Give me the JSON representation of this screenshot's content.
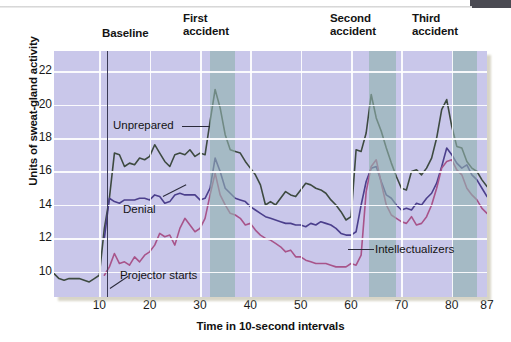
{
  "figure": {
    "corner_bar_color": "#4a4a52",
    "plot_bg_color": "#c9c7ea",
    "band_color": "#8fb2ae"
  },
  "headers": {
    "baseline": "Baseline",
    "first_accident": "First\naccident",
    "first_accident_l1": "First",
    "first_accident_l2": "accident",
    "second_accident_l1": "Second",
    "second_accident_l2": "accident",
    "third_accident_l1": "Third",
    "third_accident_l2": "accident"
  },
  "annotations": {
    "unprepared": "Unprepared",
    "denial": "Denial",
    "intellectualizers": "Intellectualizers",
    "projector_starts": "Projector starts"
  },
  "chart_data": {
    "type": "line",
    "title": "",
    "xlabel": "Time in 10-second intervals",
    "ylabel": "Units of sweat-gland activity",
    "xlim": [
      1,
      87
    ],
    "ylim": [
      8.5,
      23.2
    ],
    "xticks": [
      10,
      20,
      30,
      40,
      50,
      60,
      70,
      80,
      87
    ],
    "yticks": [
      10,
      12,
      14,
      16,
      18,
      20,
      22
    ],
    "grid": true,
    "legend": "inline-annotations",
    "event_markers": [
      {
        "name": "Projector starts",
        "x": 11.5,
        "type": "vline"
      },
      {
        "name": "First accident",
        "x_start": 32,
        "x_end": 37,
        "type": "band"
      },
      {
        "name": "Second accident",
        "x_start": 63.5,
        "x_end": 69,
        "type": "band"
      },
      {
        "name": "Third accident",
        "x_start": 80,
        "x_end": 85,
        "type": "band"
      }
    ],
    "x": [
      1,
      2,
      3,
      4,
      5,
      6,
      7,
      8,
      9,
      10,
      11,
      12,
      13,
      14,
      15,
      16,
      17,
      18,
      19,
      20,
      21,
      22,
      23,
      24,
      25,
      26,
      27,
      28,
      29,
      30,
      31,
      32,
      33,
      34,
      35,
      36,
      37,
      38,
      39,
      40,
      41,
      42,
      43,
      44,
      45,
      46,
      47,
      48,
      49,
      50,
      51,
      52,
      53,
      54,
      55,
      56,
      57,
      58,
      59,
      60,
      61,
      62,
      63,
      64,
      65,
      66,
      67,
      68,
      69,
      70,
      71,
      72,
      73,
      74,
      75,
      76,
      77,
      78,
      79,
      80,
      81,
      82,
      83,
      84,
      85,
      86,
      87
    ],
    "series": [
      {
        "name": "Unprepared",
        "color": "#3d4a40",
        "values": [
          9.9,
          9.6,
          9.5,
          9.6,
          9.6,
          9.6,
          9.5,
          9.4,
          9.6,
          9.8,
          12.6,
          14.4,
          17.1,
          17.0,
          16.3,
          16.5,
          16.4,
          16.8,
          16.7,
          16.9,
          17.6,
          17.1,
          16.6,
          16.3,
          17.0,
          17.1,
          17.0,
          17.3,
          16.9,
          17.1,
          17.0,
          19.0,
          20.9,
          19.8,
          18.2,
          17.3,
          17.2,
          17.1,
          16.6,
          16.2,
          15.8,
          15.2,
          14.0,
          14.2,
          14.0,
          14.4,
          14.8,
          14.6,
          14.5,
          14.9,
          15.3,
          15.2,
          15.0,
          14.9,
          14.7,
          14.3,
          14.0,
          13.6,
          13.1,
          13.3,
          17.3,
          17.2,
          18.3,
          20.6,
          19.2,
          18.4,
          17.4,
          16.5,
          15.7,
          15.0,
          14.9,
          16.0,
          16.1,
          15.8,
          16.2,
          16.8,
          18.0,
          19.7,
          20.3,
          18.7,
          17.5,
          17.4,
          16.6,
          16.2,
          16.0,
          15.5,
          15.1
        ]
      },
      {
        "name": "Denial",
        "color": "#4b3f8c",
        "values": [
          null,
          null,
          null,
          null,
          null,
          null,
          null,
          null,
          null,
          null,
          12.0,
          14.4,
          14.2,
          14.1,
          14.3,
          14.3,
          14.3,
          14.4,
          14.4,
          14.3,
          14.6,
          14.5,
          14.1,
          14.2,
          14.6,
          14.7,
          14.6,
          14.6,
          14.6,
          14.3,
          14.4,
          15.0,
          16.8,
          16.0,
          15.0,
          14.7,
          14.4,
          14.3,
          14.2,
          13.9,
          13.7,
          13.5,
          13.3,
          13.2,
          13.1,
          13.0,
          12.9,
          12.9,
          12.8,
          12.8,
          12.7,
          12.9,
          12.8,
          13.0,
          12.9,
          12.8,
          12.6,
          12.3,
          12.2,
          12.2,
          12.4,
          14.0,
          15.4,
          16.2,
          16.3,
          15.4,
          14.6,
          14.4,
          14.0,
          13.7,
          13.8,
          13.7,
          14.1,
          14.0,
          14.4,
          14.7,
          15.3,
          16.3,
          17.4,
          17.0,
          16.5,
          16.2,
          16.4,
          15.8,
          15.5,
          15.0,
          14.5
        ]
      },
      {
        "name": "Intellectualizers",
        "color": "#a8548a",
        "values": [
          null,
          null,
          null,
          null,
          null,
          null,
          null,
          null,
          null,
          null,
          9.8,
          10.3,
          11.1,
          10.5,
          10.6,
          10.4,
          10.9,
          10.6,
          11.0,
          11.2,
          11.6,
          12.3,
          12.1,
          12.2,
          11.6,
          12.6,
          13.2,
          12.8,
          12.4,
          12.6,
          13.2,
          14.6,
          15.9,
          14.6,
          14.0,
          13.5,
          13.4,
          13.2,
          12.8,
          12.9,
          12.5,
          12.2,
          12.0,
          11.9,
          11.7,
          11.5,
          11.2,
          11.3,
          10.9,
          10.9,
          10.7,
          10.6,
          10.5,
          10.5,
          10.5,
          10.4,
          10.3,
          10.3,
          10.3,
          10.5,
          10.4,
          11.0,
          14.8,
          16.3,
          16.7,
          15.3,
          14.0,
          13.4,
          13.2,
          13.0,
          12.9,
          13.3,
          12.8,
          12.9,
          13.3,
          14.0,
          15.0,
          16.2,
          16.6,
          16.7,
          16.1,
          15.8,
          15.0,
          14.6,
          14.3,
          13.8,
          13.5
        ]
      }
    ]
  }
}
